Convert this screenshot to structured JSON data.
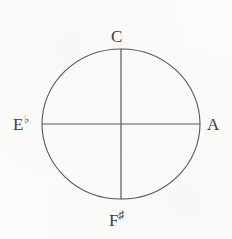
{
  "figure": {
    "type": "circle-with-diameters",
    "background_color": "#fbfbfa",
    "stroke_color": "#555555",
    "text_color": "#3c3c3c",
    "geometry": {
      "center_x": 121,
      "center_y": 124,
      "radius_x": 79,
      "radius_y": 75,
      "stroke_width": 1.1
    },
    "labels": {
      "top": {
        "note": "C",
        "accidental": ""
      },
      "right": {
        "note": "A",
        "accidental": ""
      },
      "bottom": {
        "note": "F",
        "accidental": "♯"
      },
      "left": {
        "note": "E",
        "accidental": "♭"
      }
    },
    "icons": {
      "circle": "circle-outline-icon",
      "vertical_diameter": "vertical-line-icon",
      "horizontal_diameter": "horizontal-line-icon"
    }
  }
}
